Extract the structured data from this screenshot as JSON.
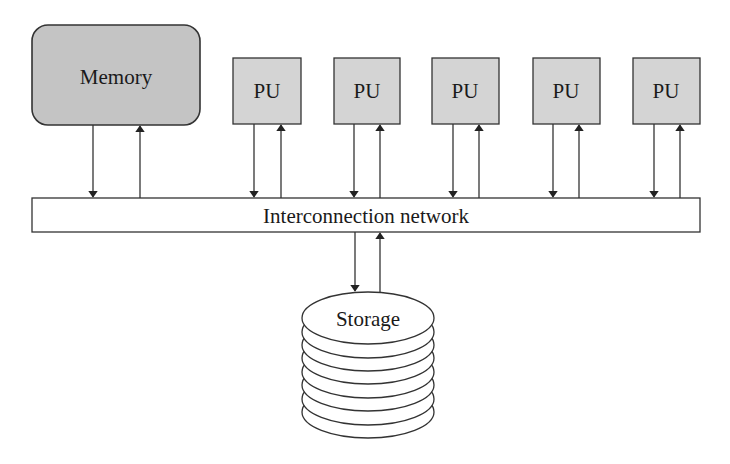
{
  "diagram": {
    "memory": {
      "label": "Memory",
      "fill": "#c4c4c4"
    },
    "processing_units": [
      {
        "label": "PU"
      },
      {
        "label": "PU"
      },
      {
        "label": "PU"
      },
      {
        "label": "PU"
      },
      {
        "label": "PU"
      }
    ],
    "pu_fill": "#d4d4d4",
    "network": {
      "label": "Interconnection network"
    },
    "storage": {
      "label": "Storage",
      "disk_layers": 8
    },
    "stroke": "#333333"
  }
}
